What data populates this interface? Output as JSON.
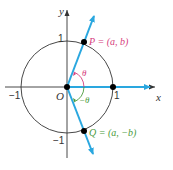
{
  "diagram": {
    "type": "unit-circle",
    "axes": {
      "x_label": "x",
      "y_label": "y",
      "origin_label": "O",
      "tick_labels": {
        "x_neg": "−1",
        "x_pos": "1",
        "y_pos": "1",
        "y_neg": "−1"
      }
    },
    "points": {
      "P": {
        "label": "P = (a, b)",
        "color": "#d6407e"
      },
      "Q": {
        "label": "Q = (a, −b)",
        "color": "#4a9b3c"
      }
    },
    "angles": {
      "theta": {
        "label": "θ",
        "color": "#d6407e"
      },
      "neg_theta": {
        "label": "−θ",
        "color": "#4a9b3c"
      }
    },
    "colors": {
      "ray": "#2aa7df",
      "axis": "#333333",
      "circle": "#333333",
      "point": "#000000"
    }
  }
}
